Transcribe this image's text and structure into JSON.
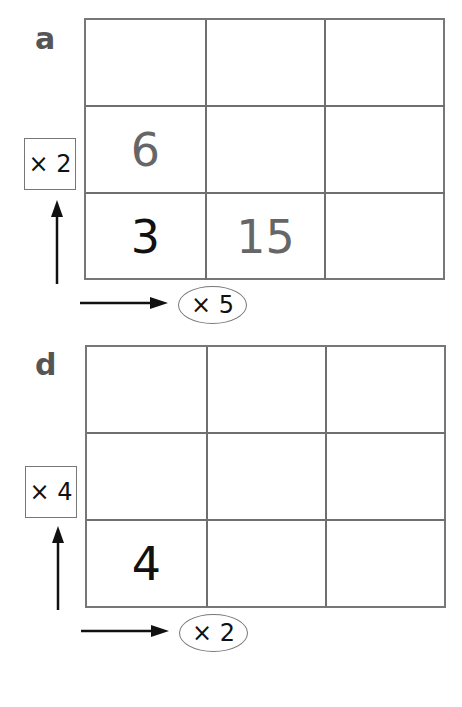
{
  "puzzles": [
    {
      "label": "a",
      "row_multiplier": "× 2",
      "col_multiplier": "× 5",
      "cells": [
        [
          "",
          "",
          ""
        ],
        [
          "6",
          "",
          ""
        ],
        [
          "3",
          "15",
          ""
        ]
      ]
    },
    {
      "label": "d",
      "row_multiplier": "× 4",
      "col_multiplier": "× 2",
      "cells": [
        [
          "",
          "",
          ""
        ],
        [
          "",
          "",
          ""
        ],
        [
          "4",
          "",
          ""
        ]
      ]
    }
  ],
  "colors": {
    "grid_line": "#6f6f6f",
    "given_number": "#111111",
    "filled_number": "#666666",
    "label": "#555555"
  }
}
